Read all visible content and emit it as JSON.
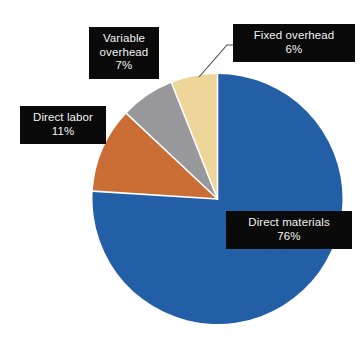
{
  "chart_data": {
    "type": "pie",
    "title": "",
    "subtitle": "",
    "xlabel": "",
    "ylabel": "",
    "legend_position": "none",
    "grid": false,
    "units": "percent",
    "total": 100,
    "categories": [
      "Direct materials",
      "Direct labor",
      "Variable overhead",
      "Fixed overhead"
    ],
    "values": [
      76,
      11,
      7,
      6
    ],
    "slices": [
      {
        "label": "Direct materials",
        "value": 76,
        "value_text": "76%",
        "color": "#2060a8",
        "start_angle_deg": 0,
        "end_angle_deg": 273.6,
        "label_placement": "inside-right"
      },
      {
        "label": "Direct labor",
        "value": 11,
        "value_text": "11%",
        "color": "#cc6f35",
        "start_angle_deg": 273.6,
        "end_angle_deg": 313.2,
        "label_placement": "outside-left"
      },
      {
        "label": "Variable overhead",
        "value": 7,
        "value_text": "7%",
        "color": "#9a9a9e",
        "start_angle_deg": 313.2,
        "end_angle_deg": 338.4,
        "label_placement": "outside-top-left"
      },
      {
        "label": "Fixed overhead",
        "value": 6,
        "value_text": "6%",
        "color": "#f0d89c",
        "start_angle_deg": 338.4,
        "end_angle_deg": 360,
        "label_placement": "outside-top-right",
        "has_leader_line": true
      }
    ],
    "colors": {
      "direct_materials": "#2060a8",
      "direct_labor": "#cc6f35",
      "variable_overhead": "#9a9a9e",
      "fixed_overhead": "#f0d89c",
      "callout_background": "#0a0a0a",
      "callout_text": "#f2f2f2",
      "slice_separator": "#ffffff",
      "background": "#ffffff",
      "leader_line": "#3a3a3a"
    }
  },
  "callouts": {
    "fixed_overhead": {
      "line1": "Fixed overhead",
      "line2": "6%"
    },
    "variable_overhead": {
      "line1": "Variable",
      "line2": "overhead",
      "line3": "7%"
    },
    "direct_labor": {
      "line1": "Direct labor",
      "line2": "11%"
    },
    "direct_materials": {
      "line1": "Direct materials",
      "line2": "76%"
    }
  }
}
